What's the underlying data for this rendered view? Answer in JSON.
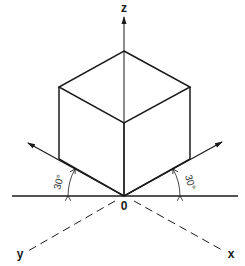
{
  "diagram": {
    "axes": {
      "z": "z",
      "x": "x",
      "y": "y",
      "origin": "0"
    },
    "angles": {
      "left": "30°",
      "right": "30°"
    }
  }
}
